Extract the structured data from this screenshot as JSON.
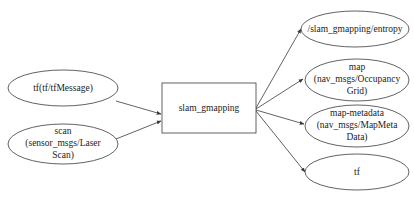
{
  "diagram": {
    "type": "ros-node-graph",
    "center_node": {
      "id": "slam_gmapping",
      "label": "slam_gmapping",
      "shape": "box"
    },
    "inputs": [
      {
        "id": "tf_in",
        "lines": [
          "tf(tf/tfMessage)"
        ],
        "shape": "ellipse"
      },
      {
        "id": "scan",
        "lines": [
          "scan",
          "(sensor_msgs/Laser",
          "Scan)"
        ],
        "shape": "ellipse"
      }
    ],
    "outputs": [
      {
        "id": "entropy",
        "lines": [
          "/slam_gmapping/entropy"
        ],
        "shape": "ellipse"
      },
      {
        "id": "map",
        "lines": [
          "map",
          "(nav_msgs/Occupancy",
          "Grid)"
        ],
        "shape": "ellipse"
      },
      {
        "id": "map_metadata",
        "lines": [
          "map-metadata",
          "(nav_msgs/MapMeta",
          "Data)"
        ],
        "shape": "ellipse"
      },
      {
        "id": "tf_out",
        "lines": [
          "tf"
        ],
        "shape": "ellipse"
      }
    ],
    "edges": [
      {
        "from": "tf_in",
        "to": "slam_gmapping"
      },
      {
        "from": "scan",
        "to": "slam_gmapping"
      },
      {
        "from": "slam_gmapping",
        "to": "entropy"
      },
      {
        "from": "slam_gmapping",
        "to": "map"
      },
      {
        "from": "slam_gmapping",
        "to": "map_metadata"
      },
      {
        "from": "slam_gmapping",
        "to": "tf_out"
      }
    ],
    "colors": {
      "stroke": "#3a3a3a",
      "text": "#222222",
      "background": "#ffffff"
    }
  }
}
